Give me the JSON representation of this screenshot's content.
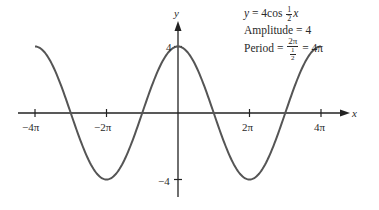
{
  "chart_data": {
    "type": "line",
    "title": "",
    "function": "y = 4cos(x/2)",
    "xlabel": "x",
    "ylabel": "y",
    "xlim": [
      -12.566,
      12.566
    ],
    "ylim": [
      -4,
      4
    ],
    "grid": false,
    "x_ticks": [
      {
        "value": -12.566,
        "label": "−4π"
      },
      {
        "value": -6.283,
        "label": "−2π"
      },
      {
        "value": 6.283,
        "label": "2π"
      },
      {
        "value": 12.566,
        "label": "4π"
      }
    ],
    "y_ticks": [
      {
        "value": 4,
        "label": "4"
      },
      {
        "value": -4,
        "label": "−4"
      }
    ],
    "series": [
      {
        "name": "y = 4cos(½x)",
        "x": [
          -12.566,
          -9.425,
          -6.283,
          -3.142,
          0,
          3.142,
          6.283,
          9.425,
          12.566
        ],
        "values": [
          4,
          0,
          -4,
          0,
          4,
          0,
          -4,
          0,
          4
        ]
      }
    ],
    "annotations": {
      "equation": {
        "prefix": "y = 4cos",
        "frac_num": "1",
        "frac_den": "2",
        "suffix": "x"
      },
      "amplitude": "Amplitude = 4",
      "period": {
        "prefix": "Period =",
        "num": "2π",
        "den_num": "1",
        "den_den": "2",
        "suffix": "= 4π"
      }
    },
    "line_color": "#555555",
    "axis_color": "#222222"
  }
}
